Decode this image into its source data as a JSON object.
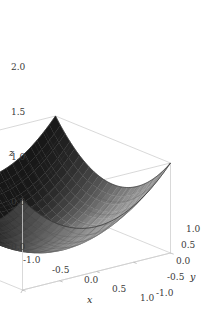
{
  "figure": {
    "kind": "surface-plot-3d",
    "background_color": "#ffffff",
    "width": 211,
    "height": 313
  },
  "chart_data": {
    "type": "surface",
    "title": "",
    "subtitle": "",
    "function": "z = x^2 + y^2",
    "xlabel": "x",
    "ylabel": "y",
    "zlabel": "z",
    "xlim": [
      -1,
      1
    ],
    "ylim": [
      -1,
      1
    ],
    "zlim": [
      0,
      2
    ],
    "x_ticks": [
      -1,
      -0.5,
      0,
      0.5,
      1
    ],
    "y_ticks": [
      1,
      0.5,
      0,
      -0.5,
      -1
    ],
    "z_ticks": [
      0,
      0.5,
      1,
      1.5,
      2
    ],
    "x_tick_labels": [
      "-1.0",
      "-0.5",
      "0.0",
      "0.5",
      "1.0"
    ],
    "y_tick_labels": [
      "1.0",
      "0.5",
      "0.0",
      "-0.5",
      "-1.0"
    ],
    "z_tick_labels": [
      "0.0",
      "0.5",
      "1.0",
      "1.5",
      "2.0"
    ],
    "grid": false,
    "mesh": true,
    "mesh_divisions": 24,
    "legend": "none",
    "box": true,
    "colors": {
      "surface_light": "#b4b4b4",
      "surface_dark": "#101010",
      "mesh_line": "#4a4a4a",
      "box_line": "#cfcfcf",
      "axis_line": "#b8b8b8",
      "tick_text": "#3a3a3a",
      "background": "#ffffff"
    },
    "camera": {
      "azimuth_deg": -37,
      "elevation_deg": 22
    },
    "corner_values": [
      {
        "x": -1,
        "y": -1,
        "z": 2
      },
      {
        "x": 1,
        "y": -1,
        "z": 2
      },
      {
        "x": -1,
        "y": 1,
        "z": 2
      },
      {
        "x": 1,
        "y": 1,
        "z": 2
      },
      {
        "x": 0,
        "y": 0,
        "z": 0
      }
    ]
  },
  "axes": {
    "z": {
      "label": "z",
      "ticks": [
        {
          "value": "2.0",
          "left": 11,
          "top": 63
        },
        {
          "value": "1.5",
          "left": 11,
          "top": 108
        },
        {
          "value": "1.0",
          "left": 11,
          "top": 153
        },
        {
          "value": "0.5",
          "left": 11,
          "top": 198
        },
        {
          "value": "0.0",
          "left": 11,
          "top": 243
        }
      ],
      "label_pos": {
        "left": 9,
        "top": 148
      }
    },
    "x": {
      "label": "x",
      "ticks": [
        {
          "value": "-1.0",
          "left": 23,
          "top": 256
        },
        {
          "value": "-0.5",
          "left": 52,
          "top": 266
        },
        {
          "value": "0.0",
          "left": 84,
          "top": 276
        },
        {
          "value": "0.5",
          "left": 112,
          "top": 285
        },
        {
          "value": "1.0",
          "left": 140,
          "top": 294
        }
      ],
      "label_pos": {
        "left": 87,
        "top": 295
      }
    },
    "y": {
      "label": "y",
      "ticks": [
        {
          "value": "1.0",
          "left": 186,
          "top": 225
        },
        {
          "value": "0.5",
          "left": 181,
          "top": 241
        },
        {
          "value": "0.0",
          "left": 176,
          "top": 257
        },
        {
          "value": "-0.5",
          "left": 167,
          "top": 273
        },
        {
          "value": "-1.0",
          "left": 156,
          "top": 289
        }
      ],
      "label_pos": {
        "left": 190,
        "top": 272
      }
    }
  }
}
